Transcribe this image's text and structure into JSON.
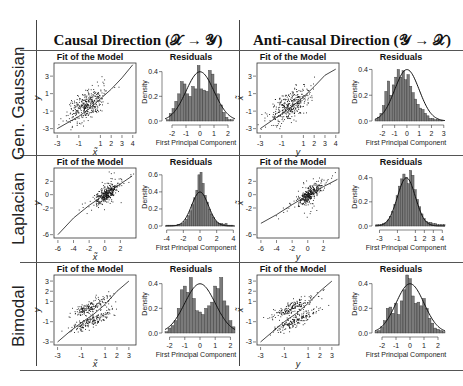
{
  "figure": {
    "columns": [
      {
        "label": "Causal Direction (𝒳 → 𝒴)"
      },
      {
        "label": "Anti-causal Direction (𝒴 → 𝒳)"
      }
    ],
    "rows": [
      {
        "label": "Gen. Gaussian"
      },
      {
        "label": "Laplacian"
      },
      {
        "label": "Bimodal"
      }
    ],
    "panel_titles": {
      "fit": "Fit of the Model",
      "residuals": "Residuals"
    },
    "hist_xlabel": "First Principal Component",
    "hist_ylabel": "Density"
  },
  "chart_data": [
    {
      "id": "gg-causal-fit",
      "type": "scatter",
      "title": "Fit of the Model",
      "xlabel": "x̃",
      "ylabel": "y",
      "xticks": [
        -3,
        -1,
        1,
        2,
        3,
        4
      ],
      "yticks": [
        -3,
        -1,
        1,
        3
      ],
      "xlim": [
        -3.3,
        4.3
      ],
      "ylim": [
        -3.5,
        4.5
      ],
      "curve": [
        [
          -3,
          -3
        ],
        [
          -1,
          -1.6
        ],
        [
          0,
          -0.7
        ],
        [
          1,
          0.4
        ],
        [
          2,
          1.5
        ],
        [
          3,
          2.8
        ],
        [
          4,
          4.3
        ]
      ]
    },
    {
      "id": "gg-causal-res",
      "type": "bar",
      "title": "Residuals",
      "xlabel": "First Principal Component",
      "ylabel": "Density",
      "xticks": [
        -2,
        -1,
        0,
        1,
        2
      ],
      "yticks": [
        0.0,
        0.2,
        0.4
      ],
      "xlim": [
        -2.5,
        2.5
      ],
      "ylim": [
        0,
        0.47
      ],
      "bin_start": -2.4,
      "bin_width": 0.2,
      "values": [
        0.01,
        0.06,
        0.1,
        0.16,
        0.22,
        0.32,
        0.3,
        0.22,
        0.2,
        0.28,
        0.26,
        0.45,
        0.26,
        0.25,
        0.24,
        0.41,
        0.38,
        0.3,
        0.22,
        0.13,
        0.07,
        0.03,
        0.01,
        0.01
      ],
      "normal_curve": true
    },
    {
      "id": "gg-anti-fit",
      "type": "scatter",
      "title": "Fit of the Model",
      "xlabel": "y",
      "ylabel": "x̃",
      "xticks": [
        -3,
        -1,
        1,
        2,
        3,
        4
      ],
      "yticks": [
        -3,
        -1,
        1,
        3
      ],
      "xlim": [
        -3.3,
        4.3
      ],
      "ylim": [
        -3.5,
        4.5
      ],
      "curve": [
        [
          -3,
          -3
        ],
        [
          -1,
          -1.3
        ],
        [
          0,
          -0.4
        ],
        [
          1,
          0.6
        ],
        [
          2,
          1.8
        ],
        [
          3,
          3.1
        ],
        [
          4,
          3.8
        ]
      ]
    },
    {
      "id": "gg-anti-res",
      "type": "bar",
      "title": "Residuals",
      "xlabel": "First Principal Component",
      "ylabel": "Density",
      "xticks": [
        -2,
        -1,
        0,
        1,
        2,
        3
      ],
      "yticks": [
        0.0,
        0.2,
        0.4
      ],
      "xlim": [
        -2.6,
        3.1
      ],
      "ylim": [
        0,
        0.45
      ],
      "bin_start": -2.6,
      "bin_width": 0.2,
      "values": [
        0.01,
        0.03,
        0.06,
        0.12,
        0.23,
        0.31,
        0.2,
        0.28,
        0.34,
        0.4,
        0.34,
        0.39,
        0.32,
        0.36,
        0.27,
        0.22,
        0.17,
        0.13,
        0.1,
        0.09,
        0.06,
        0.04,
        0.02,
        0.02,
        0.01,
        0.01,
        0.005,
        0.005
      ],
      "normal_curve": true
    },
    {
      "id": "lap-causal-fit",
      "type": "scatter",
      "title": "Fit of the Model",
      "xlabel": "x̃",
      "ylabel": "y",
      "xticks": [
        -6,
        -4,
        -2,
        0,
        2
      ],
      "yticks": [
        -6,
        -2,
        0,
        2
      ],
      "xlim": [
        -6.5,
        4
      ],
      "ylim": [
        -6.5,
        4
      ],
      "curve": [
        [
          -6,
          -6
        ],
        [
          -4,
          -3.5
        ],
        [
          -2,
          -1.6
        ],
        [
          0,
          0
        ],
        [
          2,
          1.6
        ],
        [
          3.5,
          2.8
        ]
      ]
    },
    {
      "id": "lap-causal-res",
      "type": "bar",
      "title": "Residuals",
      "xlabel": "First Principal Component",
      "ylabel": "Density",
      "xticks": [
        -4,
        -2,
        0,
        2,
        4
      ],
      "yticks": [
        0.0,
        0.2,
        0.4,
        0.6
      ],
      "xlim": [
        -4.2,
        4.2
      ],
      "ylim": [
        0,
        0.68
      ],
      "bin_start": -4,
      "bin_width": 0.25,
      "values": [
        0.01,
        0.01,
        0.01,
        0.01,
        0.01,
        0.02,
        0.02,
        0.03,
        0.05,
        0.08,
        0.12,
        0.18,
        0.25,
        0.33,
        0.42,
        0.6,
        0.63,
        0.5,
        0.36,
        0.28,
        0.2,
        0.14,
        0.1,
        0.06,
        0.04,
        0.03,
        0.03,
        0.02,
        0.03,
        0.01,
        0.01,
        0.01
      ],
      "normal_curve": true
    },
    {
      "id": "lap-anti-fit",
      "type": "scatter",
      "title": "Fit of the Model",
      "xlabel": "y",
      "ylabel": "x̃",
      "xticks": [
        -6,
        -4,
        -2,
        0,
        2
      ],
      "yticks": [
        -6,
        -2,
        0,
        2
      ],
      "xlim": [
        -6.5,
        4
      ],
      "ylim": [
        -6.5,
        4
      ],
      "curve": [
        [
          -6,
          -4.3
        ],
        [
          -4,
          -3
        ],
        [
          -2,
          -1.5
        ],
        [
          0,
          -0.1
        ],
        [
          2,
          1.2
        ],
        [
          3.8,
          2.3
        ]
      ]
    },
    {
      "id": "lap-anti-res",
      "type": "bar",
      "title": "Residuals",
      "xlabel": "First Principal Component",
      "ylabel": "Density",
      "xticks": [
        -3,
        -1,
        1,
        2,
        3,
        4
      ],
      "yticks": [
        0.0,
        0.2,
        0.4
      ],
      "xlim": [
        -3.5,
        4.3
      ],
      "ylim": [
        0,
        0.48
      ],
      "bin_start": -3.4,
      "bin_width": 0.25,
      "values": [
        0.01,
        0.01,
        0.01,
        0.02,
        0.03,
        0.05,
        0.08,
        0.12,
        0.18,
        0.25,
        0.33,
        0.39,
        0.43,
        0.4,
        0.35,
        0.46,
        0.42,
        0.3,
        0.22,
        0.16,
        0.1,
        0.06,
        0.04,
        0.03,
        0.03,
        0.02,
        0.02,
        0.01,
        0.01,
        0.01,
        0.01
      ],
      "normal_curve": true
    },
    {
      "id": "bi-causal-fit",
      "type": "scatter",
      "title": "Fit of the Model",
      "xlabel": "x̃",
      "ylabel": "y",
      "xticks": [
        -3,
        -1,
        1,
        2,
        3
      ],
      "yticks": [
        -3,
        -1,
        1,
        2,
        3
      ],
      "xlim": [
        -3.3,
        3.6
      ],
      "ylim": [
        -3.3,
        3.6
      ],
      "curve": [
        [
          -3,
          -3
        ],
        [
          -2,
          -2
        ],
        [
          -1,
          -1.1
        ],
        [
          0,
          -0.3
        ],
        [
          1,
          0.7
        ],
        [
          2,
          2
        ],
        [
          3,
          3
        ]
      ]
    },
    {
      "id": "bi-causal-res",
      "type": "bar",
      "title": "Residuals",
      "xlabel": "First Principal Component",
      "ylabel": "Density",
      "xticks": [
        -2,
        -1,
        0,
        1,
        2
      ],
      "yticks": [
        0.0,
        0.2,
        0.4
      ],
      "xlim": [
        -2.3,
        2.3
      ],
      "ylim": [
        0,
        0.47
      ],
      "bin_start": -2.3,
      "bin_width": 0.2,
      "values": [
        0.01,
        0.04,
        0.06,
        0.1,
        0.2,
        0.35,
        0.38,
        0.33,
        0.45,
        0.28,
        0.18,
        0.17,
        0.15,
        0.2,
        0.22,
        0.25,
        0.38,
        0.36,
        0.45,
        0.26,
        0.22,
        0.1,
        0.05
      ],
      "normal_curve": true
    },
    {
      "id": "bi-anti-fit",
      "type": "scatter",
      "title": "Fit of the Model",
      "xlabel": "y",
      "ylabel": "x̃",
      "xticks": [
        -3,
        -1,
        1,
        2,
        3
      ],
      "yticks": [
        -3,
        -1,
        1,
        2,
        3
      ],
      "xlim": [
        -3.3,
        3.6
      ],
      "ylim": [
        -3.3,
        3.6
      ],
      "curve": [
        [
          -3,
          -3
        ],
        [
          -2,
          -2
        ],
        [
          -1,
          -1
        ],
        [
          0,
          -0.2
        ],
        [
          1,
          0.8
        ],
        [
          2,
          2
        ],
        [
          3,
          3
        ]
      ]
    },
    {
      "id": "bi-anti-res",
      "type": "bar",
      "title": "Residuals",
      "xlabel": "First Principal Component",
      "ylabel": "Density",
      "xticks": [
        -2,
        -1,
        0,
        1,
        2
      ],
      "yticks": [
        0.0,
        0.2,
        0.4
      ],
      "xlim": [
        -2.5,
        2.5
      ],
      "ylim": [
        0,
        0.47
      ],
      "bin_start": -2.5,
      "bin_width": 0.2,
      "values": [
        0.01,
        0.02,
        0.05,
        0.1,
        0.2,
        0.21,
        0.16,
        0.24,
        0.15,
        0.26,
        0.35,
        0.47,
        0.44,
        0.3,
        0.24,
        0.25,
        0.22,
        0.28,
        0.2,
        0.12,
        0.08,
        0.04,
        0.03,
        0.02,
        0.01
      ],
      "normal_curve": true
    }
  ]
}
